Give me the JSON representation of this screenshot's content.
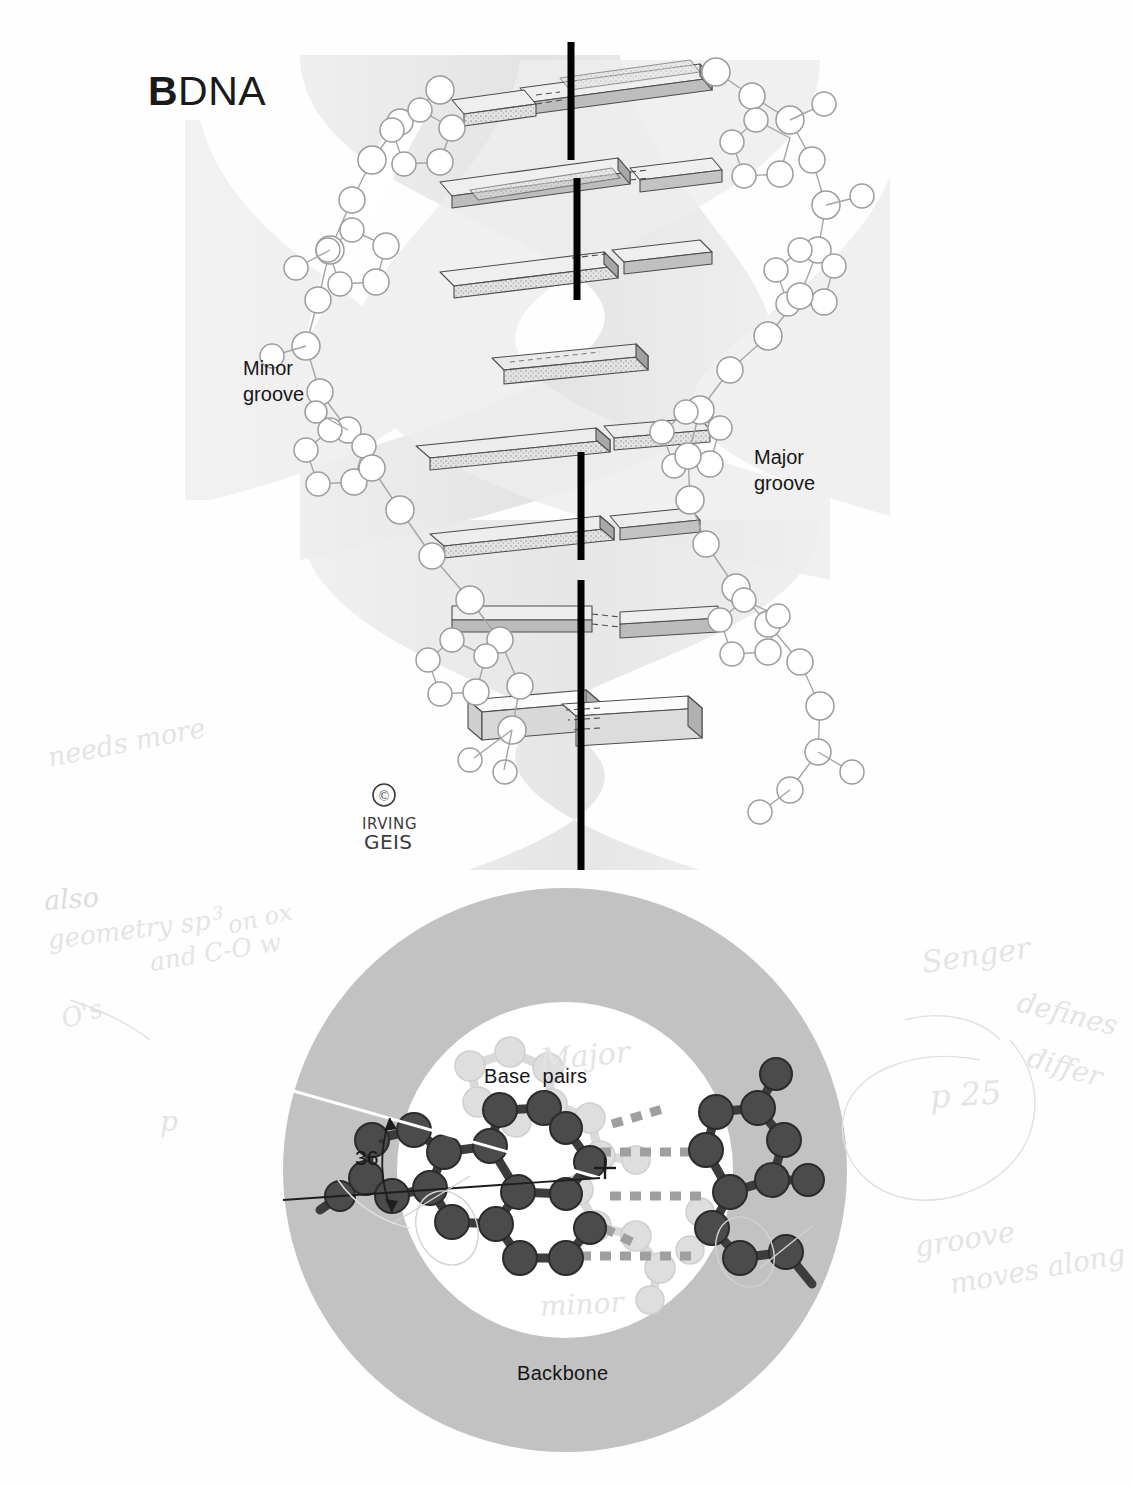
{
  "figure": {
    "title_prefix": "B",
    "title_main": "DNA",
    "full_title": "B DNA",
    "credit_symbol": "©",
    "credit_line1": "IRVING",
    "credit_line2": "GEIS"
  },
  "helix_panel": {
    "name": "b-dna-double-helix-side-view",
    "labels": {
      "minor_groove_line1": "Minor",
      "minor_groove_line2": "groove",
      "major_groove_line1": "Major",
      "major_groove_line2": "groove"
    },
    "base_pair_count": 8,
    "axis_color": "#000000",
    "ribbon_color": "#e9e9e9",
    "slab_top_color": "#f2f2f2",
    "slab_side_color": "#bfbfbf"
  },
  "axial_panel": {
    "name": "b-dna-axial-cross-section",
    "labels": {
      "base_pairs": "Base  pairs",
      "backbone": "Backbone",
      "twist_angle": "36",
      "degree_symbol": "°",
      "twist_angle_full": "36°",
      "center_marker": "+"
    },
    "outer_ring_color": "#c2c2c2",
    "inner_disc_color": "#ffffff",
    "atom_dark_color": "#4a4a4a",
    "atom_light_color": "#d6d6d6",
    "hbond_color": "#9a9a9a"
  },
  "annotations": [
    {
      "id": "ann-1",
      "text": "needs more",
      "x": 48,
      "y": 742,
      "rot": -11,
      "size": 27,
      "tone": "vfaint"
    },
    {
      "id": "ann-2",
      "text": "also",
      "x": 44,
      "y": 885,
      "rot": -4,
      "size": 27,
      "tone": "faint"
    },
    {
      "id": "ann-3",
      "text": "geometry sp",
      "x": 48,
      "y": 925,
      "rot": -7,
      "size": 26,
      "tone": "vfaint"
    },
    {
      "id": "ann-3b",
      "text": "3",
      "x": 212,
      "y": 903,
      "rot": -7,
      "size": 18,
      "tone": "vfaint"
    },
    {
      "id": "ann-3c",
      "text": "on ox",
      "x": 228,
      "y": 912,
      "rot": -13,
      "size": 24,
      "tone": "vfaint"
    },
    {
      "id": "ann-4",
      "text": "and C-O w",
      "x": 150,
      "y": 948,
      "rot": -9,
      "size": 25,
      "tone": "vfaint"
    },
    {
      "id": "ann-5",
      "text": "O's",
      "x": 62,
      "y": 1005,
      "rot": -18,
      "size": 26,
      "tone": "vfaint"
    },
    {
      "id": "ann-6",
      "text": "p",
      "x": 160,
      "y": 1105,
      "rot": 0,
      "size": 28,
      "tone": "vfaint"
    },
    {
      "id": "ann-7",
      "text": "Senger",
      "x": 922,
      "y": 945,
      "rot": -8,
      "size": 30,
      "tone": "vfaint"
    },
    {
      "id": "ann-8",
      "text": "defines",
      "x": 1018,
      "y": 985,
      "rot": 14,
      "size": 28,
      "tone": "vfaint"
    },
    {
      "id": "ann-9",
      "text": "p 25",
      "x": 930,
      "y": 1078,
      "rot": -4,
      "size": 32,
      "tone": "vfaint"
    },
    {
      "id": "ann-10",
      "text": "differ",
      "x": 1028,
      "y": 1040,
      "rot": 16,
      "size": 28,
      "tone": "vfaint"
    },
    {
      "id": "ann-11",
      "text": "groove",
      "x": 915,
      "y": 1230,
      "rot": -9,
      "size": 29,
      "tone": "vfaint"
    },
    {
      "id": "ann-12",
      "text": "moves along",
      "x": 950,
      "y": 1268,
      "rot": -10,
      "size": 28,
      "tone": "vfaint"
    },
    {
      "id": "ann-13",
      "text": "Major",
      "x": 540,
      "y": 1042,
      "rot": -5,
      "size": 30,
      "tone": "vfaint"
    },
    {
      "id": "ann-14",
      "text": "minor",
      "x": 540,
      "y": 1290,
      "rot": -3,
      "size": 28,
      "tone": "vfaint"
    }
  ]
}
